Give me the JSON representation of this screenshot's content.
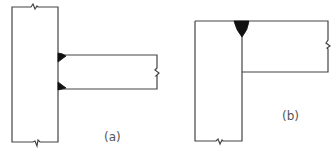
{
  "figure": {
    "colors": {
      "line": "#444444",
      "weld": "#111111",
      "label": "#555555",
      "background": "#ffffff"
    },
    "panels": [
      {
        "id": "a",
        "label": "(a)",
        "joint_type": "T-joint with two fillet welds",
        "members": [
          "vertical-plate",
          "horizontal-plate"
        ],
        "welds": 2,
        "break_marks": [
          "top",
          "bottom",
          "right"
        ]
      },
      {
        "id": "b",
        "label": "(b)",
        "joint_type": "Corner joint with single V groove weld",
        "members": [
          "vertical-plate",
          "horizontal-plate"
        ],
        "welds": 1,
        "break_marks": [
          "bottom",
          "right"
        ]
      }
    ]
  }
}
